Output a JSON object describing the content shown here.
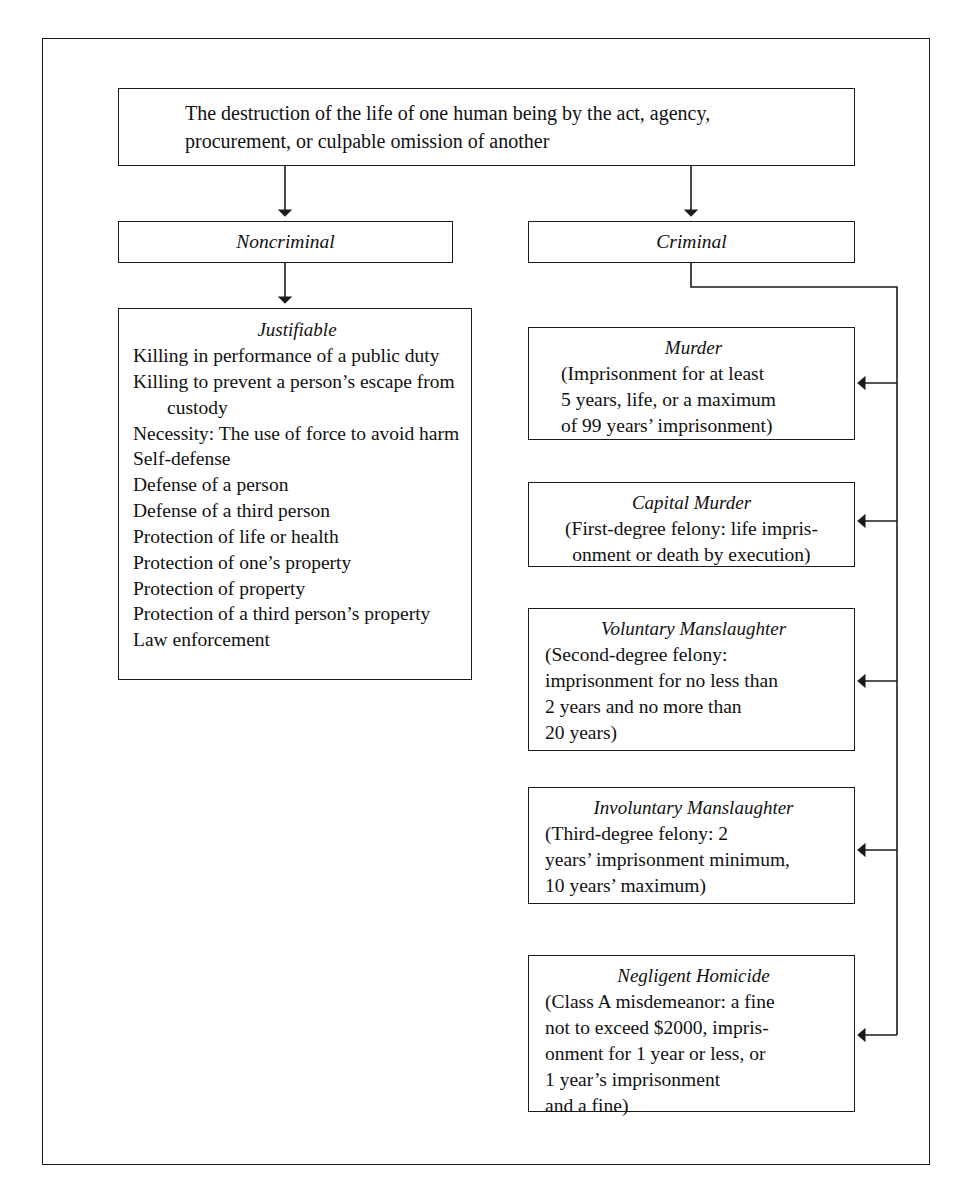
{
  "diagram": {
    "root": {
      "lines": [
        "The destruction of the life of one human being by the act, agency,",
        "procurement, or culpable omission of another"
      ]
    },
    "branches": {
      "noncriminal": {
        "title": "Noncriminal"
      },
      "criminal": {
        "title": "Criminal"
      }
    },
    "justifiable": {
      "title": "Justifiable",
      "items": [
        "Killing in performance of a public duty",
        "Killing to prevent a person’s escape from custody",
        "Necessity: The use of force to avoid harm",
        "Self-defense",
        "Defense of a person",
        "Defense of a third person",
        "Protection of life or health",
        "Protection of one’s property",
        "Protection of property",
        "Protection of a third person’s property",
        "Law enforcement"
      ]
    },
    "crimes": [
      {
        "title": "Murder",
        "lines": [
          "(Imprisonment for at least",
          "5 years, life, or a maximum",
          "of 99 years’ imprisonment)"
        ]
      },
      {
        "title": "Capital Murder",
        "lines": [
          "(First-degree felony: life impris-",
          "onment or death by execution)"
        ]
      },
      {
        "title": "Voluntary Manslaughter",
        "lines": [
          "(Second-degree felony:",
          "imprisonment for no less than",
          "2 years and no more than",
          "20 years)"
        ]
      },
      {
        "title": "Involuntary Manslaughter",
        "lines": [
          "(Third-degree felony: 2",
          "years’ imprisonment minimum,",
          "10 years’ maximum)"
        ]
      },
      {
        "title": "Negligent Homicide",
        "lines": [
          "(Class A misdemeanor: a fine",
          "not to exceed $2000, impris-",
          "onment for 1 year or less, or",
          "1 year’s imprisonment",
          "and a fine)"
        ]
      }
    ],
    "colors": {
      "line": "#1a1a1a",
      "background": "#ffffff",
      "text": "#111111"
    }
  }
}
